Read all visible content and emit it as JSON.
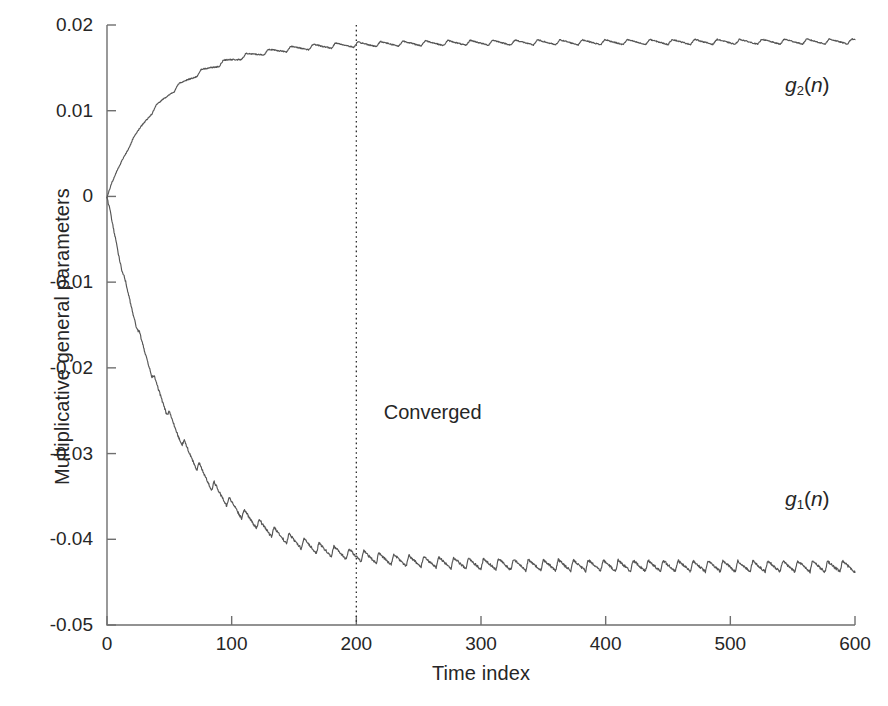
{
  "chart_data": {
    "type": "line",
    "title": "",
    "xlabel": "Time index",
    "ylabel": "Multiplicative general parameters",
    "xlim": [
      0,
      600
    ],
    "ylim": [
      -0.05,
      0.02
    ],
    "xticks": [
      0,
      100,
      200,
      300,
      400,
      500,
      600
    ],
    "xtick_labels": [
      "0",
      "100",
      "200",
      "300",
      "400",
      "500",
      "600"
    ],
    "yticks": [
      0.02,
      0.01,
      0,
      -0.01,
      -0.02,
      -0.03,
      -0.04,
      -0.05
    ],
    "ytick_labels": [
      "0.02",
      "0.01",
      "0",
      "-0.01",
      "-0.02",
      "-0.03",
      "-0.04",
      "-0.05"
    ],
    "grid": false,
    "legend_position": "inline-annotations",
    "line_color": "#555555",
    "series": [
      {
        "name": "g_2(n)",
        "label_text": "g",
        "label_sub": "2",
        "label_paren": "(n)",
        "label_x": 600,
        "label_y": 0.0128,
        "start_value": 0,
        "converged_value": 0.0178,
        "time_constant": 45,
        "ripple_amplitude": 0.0006,
        "ripple_period": 18,
        "x": [
          0,
          10,
          20,
          30,
          40,
          50,
          60,
          70,
          80,
          90,
          100,
          120,
          140,
          160,
          180,
          200,
          250,
          300,
          350,
          400,
          450,
          500,
          550,
          600
        ],
        "values": [
          0.0,
          0.0018,
          0.0043,
          0.0067,
          0.0088,
          0.0105,
          0.0119,
          0.0131,
          0.0141,
          0.0149,
          0.0155,
          0.0164,
          0.0169,
          0.0173,
          0.0175,
          0.0176,
          0.0177,
          0.0178,
          0.0178,
          0.0179,
          0.0179,
          0.018,
          0.018,
          0.0181
        ]
      },
      {
        "name": "g_1(n)",
        "label_text": "g",
        "label_sub": "1",
        "label_paren": "(n)",
        "label_x": 600,
        "label_y": -0.0355,
        "start_value": 0,
        "converged_value": -0.043,
        "time_constant": 55,
        "ripple_amplitude": 0.0013,
        "ripple_period": 12,
        "x": [
          0,
          10,
          20,
          30,
          40,
          50,
          60,
          70,
          80,
          90,
          100,
          120,
          140,
          160,
          180,
          200,
          250,
          300,
          350,
          400,
          450,
          500,
          550,
          600
        ],
        "values": [
          0.0,
          -0.0016,
          -0.0052,
          -0.0093,
          -0.0136,
          -0.0177,
          -0.0214,
          -0.0248,
          -0.0278,
          -0.0304,
          -0.0327,
          -0.0363,
          -0.0389,
          -0.0406,
          -0.0418,
          -0.0425,
          -0.043,
          -0.0431,
          -0.0431,
          -0.0431,
          -0.0431,
          -0.0432,
          -0.0432,
          -0.0432
        ]
      }
    ],
    "annotations": [
      {
        "name": "converged-label",
        "text": "Converged",
        "x": 222,
        "y": -0.0255
      }
    ],
    "marker_lines": [
      {
        "name": "convergence-marker",
        "orientation": "vertical",
        "x": 200,
        "style": "dotted"
      }
    ]
  }
}
